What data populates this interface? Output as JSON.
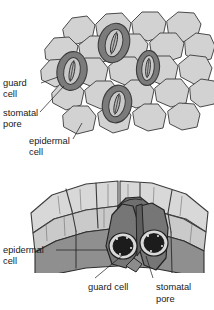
{
  "figure": {
    "panels": [
      {
        "id": "surface-view",
        "name": "surface view of epidermis with stomata",
        "labels": [
          {
            "id": "guard-cell-top",
            "line1": "guard",
            "line2": "cell"
          },
          {
            "id": "stomatal-pore-top",
            "line1": "stomatal",
            "line2": "pore"
          },
          {
            "id": "epidermal-cell-top",
            "line1": "epidermal",
            "line2": "cell"
          }
        ]
      },
      {
        "id": "cutaway-view",
        "name": "three-dimensional cutaway of epidermis",
        "labels": [
          {
            "id": "epidermal-cell-bottom",
            "line1": "epidermal",
            "line2": "cell"
          },
          {
            "id": "guard-cell-bottom",
            "line1": "guard cell",
            "line2": ""
          },
          {
            "id": "stomatal-pore-bottom",
            "line1": "stomatal",
            "line2": "pore"
          }
        ]
      }
    ]
  },
  "colors": {
    "background": "#ffffff",
    "epidermal_fill": "#d2d2d2",
    "epidermal_fill_light": "#dcdcdc",
    "epidermal_front_face": "#9a9a9a",
    "guard_cell_fill": "#8a8a8a",
    "guard_cell_dark": "#6b6b6b",
    "pore_fill": "#1e1e1e",
    "outline": "#4a4a4a",
    "text": "#1a1a1a"
  },
  "counts": {
    "stomata_surface_view": 3,
    "stomata_cutaway_view": 2
  }
}
